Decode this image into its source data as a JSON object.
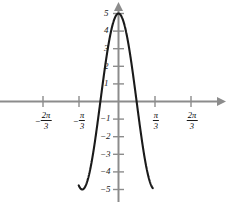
{
  "chart_data": {
    "type": "line",
    "title": "",
    "xlabel": "",
    "ylabel": "",
    "function": "y = 5 cos(3x)",
    "amplitude": 5,
    "period": "2π/3",
    "xlim": [
      -1.15,
      0.99
    ],
    "ylim": [
      -5.8,
      5.6
    ],
    "grid": false,
    "legend": null,
    "x_tick_labels": [
      "-2π/3",
      "-π/3",
      "π/3",
      "2π/3"
    ],
    "x_tick_values": [
      -2.0944,
      -1.0472,
      1.0472,
      2.0944
    ],
    "y_tick_labels": [
      "5",
      "4",
      "3",
      "2",
      "1",
      "-1",
      "-2",
      "-3",
      "-4",
      "-5"
    ],
    "y_tick_values": [
      5,
      4,
      3,
      2,
      1,
      -1,
      -2,
      -3,
      -4,
      -5
    ],
    "key_points": {
      "maxima_x": [
        -2.0944,
        0,
        2.0944
      ],
      "maxima_y": 5,
      "minima_x": [
        -1.0472,
        1.0472
      ],
      "minima_y": -5,
      "zeros_x": [
        -1.5708,
        -0.5236,
        0.5236,
        1.5708
      ]
    },
    "colors": {
      "curve": "#1a1a1a",
      "axis": "#8c8c8c",
      "tick": "#8c8c8c",
      "label": "#1a1a1a",
      "background": "#ffffff"
    }
  },
  "axis_ticks": {
    "x": [
      {
        "label_sign": "−",
        "num": "2π",
        "den": "3",
        "px": 43
      },
      {
        "label_sign": "−",
        "num": "π",
        "den": "3",
        "px": 79
      },
      {
        "label_sign": "",
        "num": "π",
        "den": "3",
        "px": 155
      },
      {
        "label_sign": "",
        "num": "2π",
        "den": "3",
        "px": 191
      }
    ],
    "y": [
      {
        "label": "5",
        "px": 13
      },
      {
        "label": "4",
        "px": 31
      },
      {
        "label": "3",
        "px": 49
      },
      {
        "label": "2",
        "px": 66
      },
      {
        "label": "1",
        "px": 84
      },
      {
        "label": "−1",
        "px": 119
      },
      {
        "label": "−2",
        "px": 137
      },
      {
        "label": "−3",
        "px": 154
      },
      {
        "label": "−4",
        "px": 172
      },
      {
        "label": "−5",
        "px": 190
      }
    ]
  }
}
